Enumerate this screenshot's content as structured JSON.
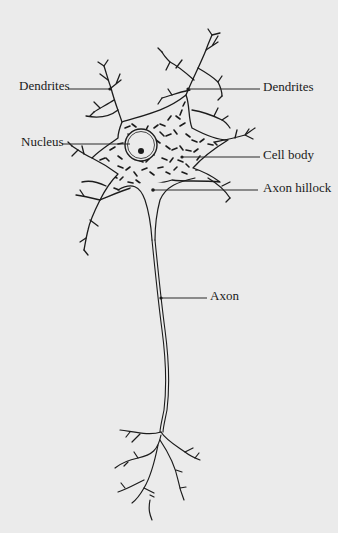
{
  "diagram": {
    "labels": {
      "dendrites_left": "Dendrites",
      "dendrites_right": "Dendrites",
      "nucleus": "Nucleus",
      "cell_body": "Cell body",
      "axon_hillock": "Axon hillock",
      "axon": "Axon"
    },
    "colors": {
      "background": "#ebebeb",
      "ink": "#1c1c1c"
    }
  }
}
